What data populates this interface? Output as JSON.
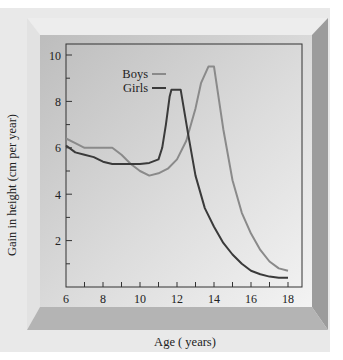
{
  "chart_data": {
    "type": "line",
    "title": "",
    "xlabel": "Age ( years)",
    "ylabel": "Gain in height (cm per year)",
    "xlim": [
      6,
      18
    ],
    "ylim": [
      0,
      10
    ],
    "xticks": [
      6,
      8,
      10,
      12,
      14,
      16,
      18
    ],
    "yticks": [
      2,
      4,
      6,
      8,
      10
    ],
    "grid": false,
    "legend_position": "upper-left",
    "series": [
      {
        "name": "Boys",
        "color": "#8a8a8a",
        "x": [
          6,
          6.5,
          7,
          8,
          8.5,
          9,
          9.5,
          10,
          10.5,
          11,
          11.5,
          12,
          12.5,
          13,
          13.3,
          13.7,
          14,
          14.5,
          15,
          15.5,
          16,
          16.5,
          17,
          17.5,
          18
        ],
        "y": [
          6.4,
          6.2,
          6.0,
          6.0,
          6.0,
          5.7,
          5.3,
          5.0,
          4.8,
          4.9,
          5.1,
          5.5,
          6.3,
          7.7,
          8.8,
          9.5,
          9.5,
          6.8,
          4.6,
          3.2,
          2.3,
          1.6,
          1.1,
          0.8,
          0.7
        ]
      },
      {
        "name": "Girls",
        "color": "#3a3a3a",
        "x": [
          6,
          6.5,
          7,
          7.5,
          8,
          8.5,
          9,
          9.5,
          10,
          10.5,
          11,
          11.2,
          11.4,
          11.6,
          11.7,
          12.0,
          12.2,
          12.6,
          13,
          13.5,
          14,
          14.5,
          15,
          15.5,
          16,
          16.5,
          17,
          17.5,
          18
        ],
        "y": [
          6.1,
          5.8,
          5.7,
          5.6,
          5.4,
          5.3,
          5.3,
          5.3,
          5.3,
          5.35,
          5.5,
          6.0,
          7.0,
          8.2,
          8.5,
          8.5,
          8.5,
          6.6,
          4.8,
          3.4,
          2.6,
          1.9,
          1.4,
          1.0,
          0.7,
          0.55,
          0.45,
          0.4,
          0.4
        ]
      }
    ]
  },
  "legend": {
    "items": [
      {
        "label": "Boys",
        "color": "#8a8a8a"
      },
      {
        "label": "Girls",
        "color": "#3a3a3a"
      }
    ]
  },
  "axes": {
    "xlabel": "Age ( years)",
    "ylabel": "Gain in height (cm per year)",
    "xtick_labels": [
      "6",
      "8",
      "10",
      "12",
      "14",
      "16",
      "18"
    ],
    "ytick_labels": [
      "2",
      "4",
      "6",
      "8",
      "10"
    ]
  }
}
